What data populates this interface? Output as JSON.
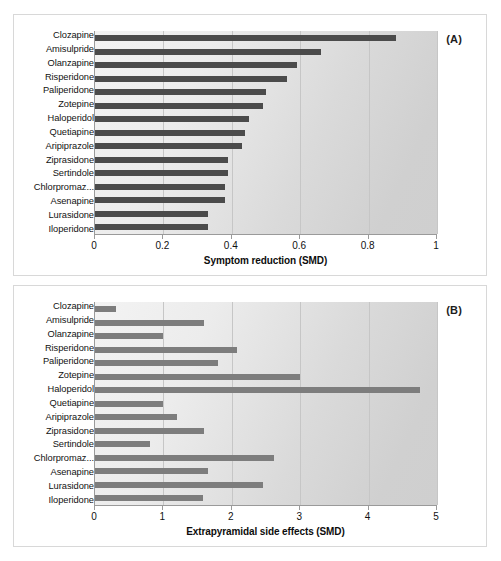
{
  "figure": {
    "background": "#ffffff",
    "panel_border_color": "#d8d8d8"
  },
  "panels": [
    {
      "letter": "(A)",
      "axis_title": "Symptom reduction (SMD)",
      "bar_color": "#4b4b4b"
    },
    {
      "letter": "(B)",
      "axis_title": "Extrapyramidal side effects (SMD)",
      "bar_color": "#7d7d7d"
    }
  ],
  "chart_data": [
    {
      "type": "bar",
      "orientation": "horizontal",
      "panel": "(A)",
      "title": "",
      "xlabel": "Symptom reduction (SMD)",
      "ylabel": "",
      "xlim": [
        0,
        1
      ],
      "xticks": [
        0,
        0.2,
        0.4,
        0.6,
        0.8,
        1
      ],
      "xticklabels": [
        "0",
        "0.2",
        "0.4",
        "0.6",
        "0.8",
        "1"
      ],
      "grid": true,
      "legend": false,
      "bar_color": "#4b4b4b",
      "categories": [
        "Clozapine",
        "Amisulpride",
        "Olanzapine",
        "Risperidone",
        "Paliperidone",
        "Zotepine",
        "Haloperidol",
        "Quetiapine",
        "Aripiprazole",
        "Ziprasidone",
        "Sertindole",
        "Chlorpromaz...",
        "Asenapine",
        "Lurasidone",
        "Iloperidone"
      ],
      "values": [
        0.88,
        0.66,
        0.59,
        0.56,
        0.5,
        0.49,
        0.45,
        0.44,
        0.43,
        0.39,
        0.39,
        0.38,
        0.38,
        0.33,
        0.33
      ]
    },
    {
      "type": "bar",
      "orientation": "horizontal",
      "panel": "(B)",
      "title": "",
      "xlabel": "Extrapyramidal side effects (SMD)",
      "ylabel": "",
      "xlim": [
        0,
        5
      ],
      "xticks": [
        0,
        1,
        2,
        3,
        4,
        5
      ],
      "xticklabels": [
        "0",
        "1",
        "2",
        "3",
        "4",
        "5"
      ],
      "grid": true,
      "legend": false,
      "bar_color": "#7d7d7d",
      "categories": [
        "Clozapine",
        "Amisulpride",
        "Olanzapine",
        "Risperidone",
        "Paliperidone",
        "Zotepine",
        "Haloperidol",
        "Quetiapine",
        "Aripiprazole",
        "Ziprasidone",
        "Sertindole",
        "Chlorpromaz...",
        "Asenapine",
        "Lurasidone",
        "Iloperidone"
      ],
      "values": [
        0.3,
        1.6,
        1.0,
        2.08,
        1.8,
        3.0,
        4.75,
        1.0,
        1.2,
        1.6,
        0.8,
        2.62,
        1.65,
        2.45,
        1.58
      ]
    }
  ]
}
